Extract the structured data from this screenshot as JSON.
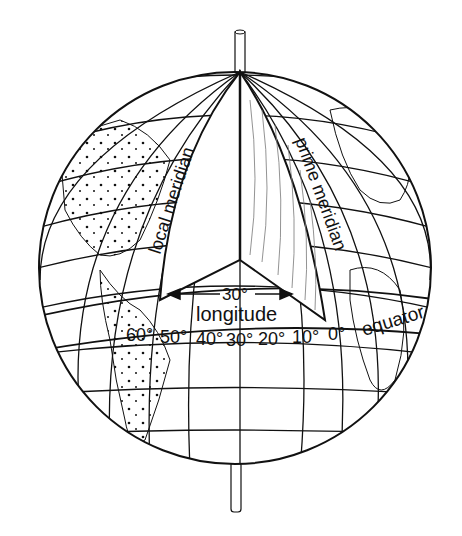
{
  "diagram": {
    "labels": {
      "local_meridian": "local meridian",
      "prime_meridian": "prime meridian",
      "angle": "30°",
      "longitude": "longitude",
      "equator": "equator"
    },
    "equator_ticks": [
      "60°",
      "50°",
      "40°",
      "30°",
      "20°",
      "10°",
      "0°"
    ],
    "colors": {
      "line": "#111111",
      "background": "#ffffff"
    }
  }
}
